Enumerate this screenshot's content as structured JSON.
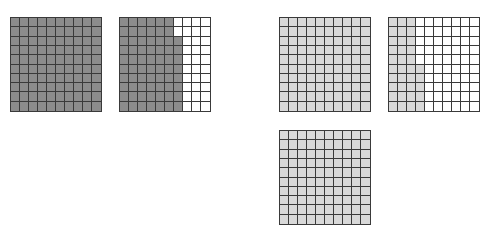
{
  "colors": {
    "dark_shade": "#8c8c8c",
    "light_shade": "#d9d9d9",
    "empty": "#ffffff",
    "line": "#3a3a3a"
  },
  "grids": [
    {
      "id": "grid-1",
      "left": 10,
      "top": 17,
      "shade": "dark",
      "shaded_count": 100,
      "shaded_per_row": [
        10,
        10,
        10,
        10,
        10,
        10,
        10,
        10,
        10,
        10
      ]
    },
    {
      "id": "grid-2",
      "left": 119,
      "top": 17,
      "shade": "dark",
      "shaded_count": 68,
      "shaded_per_row": [
        6,
        6,
        7,
        7,
        7,
        7,
        7,
        7,
        7,
        7
      ]
    },
    {
      "id": "grid-3",
      "left": 279,
      "top": 17,
      "shade": "light",
      "shaded_count": 100,
      "shaded_per_row": [
        10,
        10,
        10,
        10,
        10,
        10,
        10,
        10,
        10,
        10
      ]
    },
    {
      "id": "grid-4",
      "left": 388,
      "top": 17,
      "shade": "light",
      "shaded_count": 35,
      "shaded_per_row": [
        3,
        3,
        3,
        3,
        3,
        4,
        4,
        4,
        4,
        4
      ]
    },
    {
      "id": "grid-5",
      "left": 279,
      "top": 130,
      "shade": "light",
      "shaded_count": 100,
      "shaded_per_row": [
        10,
        10,
        10,
        10,
        10,
        10,
        10,
        10,
        10,
        10
      ]
    }
  ]
}
